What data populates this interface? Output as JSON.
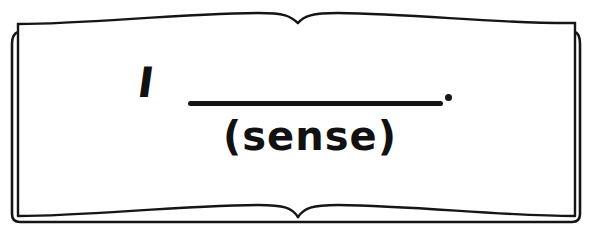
{
  "worksheet": {
    "sentence": {
      "subject": "I",
      "blank": "",
      "terminal_punctuation": "."
    },
    "hint": "(sense)"
  },
  "colors": {
    "ink": "#151515",
    "page": "#ffffff"
  }
}
